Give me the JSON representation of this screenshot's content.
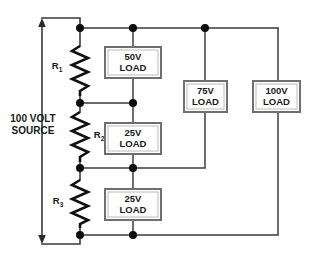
{
  "diagram": {
    "source": {
      "label_line1": "100 VOLT",
      "label_line2": "SOURCE",
      "value": "100 V",
      "arrow_direction": "down"
    },
    "resistors": [
      {
        "id": "R1",
        "label": "R",
        "subscript": "1",
        "name": "resistor-r1"
      },
      {
        "id": "R2",
        "label": "R",
        "subscript": "2",
        "name": "resistor-r2"
      },
      {
        "id": "R3",
        "label": "R",
        "subscript": "3",
        "name": "resistor-r3"
      }
    ],
    "loads": [
      {
        "id": "load-50v",
        "voltage": "50V",
        "label": "LOAD",
        "name": "load-box-50v"
      },
      {
        "id": "load-25v-upper",
        "voltage": "25V",
        "label": "LOAD",
        "name": "load-box-25v-upper"
      },
      {
        "id": "load-25v-lower",
        "voltage": "25V",
        "label": "LOAD",
        "name": "load-box-25v-lower"
      },
      {
        "id": "load-75v",
        "voltage": "75V",
        "label": "LOAD",
        "name": "load-box-75v"
      },
      {
        "id": "load-100v",
        "voltage": "100V",
        "label": "LOAD",
        "name": "load-box-100v"
      }
    ],
    "colors": {
      "wire": "#3a3a3a",
      "resistor": "#111111",
      "node": "#0c0c0c",
      "load_border": "#6f6f6f",
      "load_fill": "#ffffff",
      "text": "#1a1a1a",
      "background": "#ffffff"
    }
  }
}
